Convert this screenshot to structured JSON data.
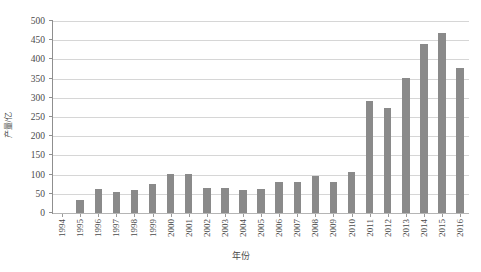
{
  "chart_data": {
    "type": "bar",
    "title": "",
    "xlabel": "年份",
    "ylabel": "产量/亿",
    "categories": [
      "1994",
      "1995",
      "1996",
      "1997",
      "1998",
      "1999",
      "2000",
      "2001",
      "2002",
      "2003",
      "2004",
      "2005",
      "2006",
      "2007",
      "2008",
      "2009",
      "2010",
      "2011",
      "2012",
      "2013",
      "2014",
      "2015",
      "2016"
    ],
    "values": [
      0,
      34,
      62,
      54,
      60,
      76,
      101,
      101,
      64,
      65,
      60,
      63,
      81,
      81,
      97,
      81,
      107,
      292,
      274,
      351,
      441,
      470,
      377
    ],
    "series": [
      {
        "name": "产量",
        "values": [
          0,
          34,
          62,
          54,
          60,
          76,
          101,
          101,
          64,
          65,
          60,
          63,
          81,
          81,
          97,
          81,
          107,
          292,
          274,
          351,
          441,
          470,
          377
        ]
      }
    ],
    "ylim": [
      0,
      500
    ],
    "y_ticks": [
      0,
      50,
      100,
      150,
      200,
      250,
      300,
      350,
      400,
      450,
      500
    ],
    "y_tick_labels": [
      "0",
      "50",
      "100",
      "150",
      "200",
      "250",
      "300",
      "350",
      "400",
      "450",
      "500"
    ],
    "grid": "horizontal",
    "legend": "none",
    "bar_color": "#8a8a8a",
    "gridline_color": "#d6d6d6",
    "axis_color": "#8f8f8f",
    "text_color": "#4a4a4a",
    "background": "#ffffff"
  }
}
